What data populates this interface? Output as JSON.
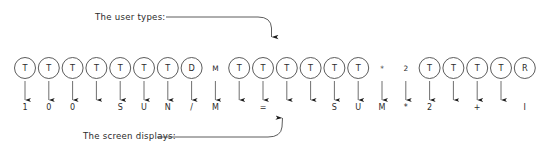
{
  "diagram": {
    "colors": {
      "stroke": "#4a4a4a",
      "text": "#2b2b2b",
      "background": "#ffffff",
      "arrow": "#1a1a1a"
    },
    "annotations": {
      "top_label": "The user types:",
      "bottom_label": "The screen displays:"
    },
    "tokens": [
      {
        "index": 0,
        "circled": true,
        "top": "T",
        "bottom": "1"
      },
      {
        "index": 1,
        "circled": true,
        "top": "T",
        "bottom": "0"
      },
      {
        "index": 2,
        "circled": true,
        "top": "T",
        "bottom": "0"
      },
      {
        "index": 3,
        "circled": true,
        "top": "T",
        "bottom": ""
      },
      {
        "index": 4,
        "circled": true,
        "top": "T",
        "bottom": "S"
      },
      {
        "index": 5,
        "circled": true,
        "top": "T",
        "bottom": "U"
      },
      {
        "index": 6,
        "circled": true,
        "top": "T",
        "bottom": "N"
      },
      {
        "index": 7,
        "circled": true,
        "top": "D",
        "bottom": "/"
      },
      {
        "index": 8,
        "circled": false,
        "top": "M",
        "bottom": "M"
      },
      {
        "index": 9,
        "circled": true,
        "top": "T",
        "bottom": ""
      },
      {
        "index": 10,
        "circled": true,
        "top": "T",
        "bottom": "="
      },
      {
        "index": 11,
        "circled": true,
        "top": "T",
        "bottom": ""
      },
      {
        "index": 12,
        "circled": true,
        "top": "T",
        "bottom": ""
      },
      {
        "index": 13,
        "circled": true,
        "top": "T",
        "bottom": "S"
      },
      {
        "index": 14,
        "circled": true,
        "top": "T",
        "bottom": "U"
      },
      {
        "index": 15,
        "circled": false,
        "top": "*",
        "bottom": "M"
      },
      {
        "index": 16,
        "circled": false,
        "top": "2",
        "bottom": "*"
      },
      {
        "index": 17,
        "circled": true,
        "top": "T",
        "bottom": "2"
      },
      {
        "index": 18,
        "circled": true,
        "top": "T",
        "bottom": ""
      },
      {
        "index": 19,
        "circled": true,
        "top": "T",
        "bottom": "+"
      },
      {
        "index": 20,
        "circled": true,
        "top": "T",
        "bottom": ""
      },
      {
        "index": 21,
        "circled": true,
        "top": "R",
        "bottom": "I"
      }
    ],
    "layout": {
      "first_center_x": 25,
      "spacing_x": 23.8,
      "circle_cy": 68,
      "circle_r": 10.5,
      "bottom_text_y": 110,
      "arrow_top_y": 81,
      "arrow_bottom_y": 100
    }
  }
}
